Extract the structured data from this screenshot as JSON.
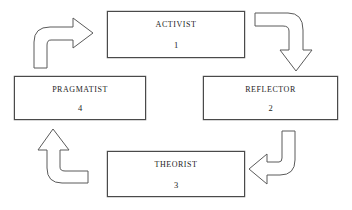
{
  "diagram": {
    "type": "cycle-diagram",
    "background_color": "#ffffff",
    "line_color": "#5a5a5a",
    "text_color": "#1d1d1d",
    "nodes": [
      {
        "id": "activist",
        "label": "ACTIVIST",
        "number": "1",
        "position": "top"
      },
      {
        "id": "reflector",
        "label": "REFLECTOR",
        "number": "2",
        "position": "right"
      },
      {
        "id": "theorist",
        "label": "THEORIST",
        "number": "3",
        "position": "bottom"
      },
      {
        "id": "pragmatist",
        "label": "PRAGMATIST",
        "number": "4",
        "position": "left"
      }
    ],
    "arrows": [
      {
        "id": "activist-to-reflector",
        "from": "activist",
        "to": "reflector",
        "direction": "down",
        "location": "top-right"
      },
      {
        "id": "reflector-to-theorist",
        "from": "reflector",
        "to": "theorist",
        "direction": "left",
        "location": "bottom-right"
      },
      {
        "id": "theorist-to-pragmatist",
        "from": "theorist",
        "to": "pragmatist",
        "direction": "up",
        "location": "bottom-left"
      },
      {
        "id": "pragmatist-to-activist",
        "from": "pragmatist",
        "to": "activist",
        "direction": "right",
        "location": "top-left"
      }
    ]
  }
}
